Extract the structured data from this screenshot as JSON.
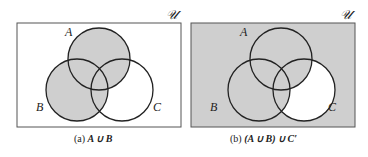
{
  "figure": {
    "panels": [
      {
        "id": "a",
        "caption_prefix": "(a)",
        "caption_expr": "A ∪ B",
        "universe_label": "𝒰",
        "labels": {
          "A": "A",
          "B": "B",
          "C": "C"
        },
        "shaded_regions": [
          "A",
          "B"
        ]
      },
      {
        "id": "b",
        "caption_prefix": "(b)",
        "caption_expr": "(A ∪ B) ∪ C′",
        "universe_label": "𝒰",
        "labels": {
          "A": "A",
          "B": "B",
          "C": "C"
        },
        "shaded_regions": [
          "everything except C \\ (A ∪ B)"
        ]
      }
    ],
    "colors": {
      "shade": "#cfcfcf",
      "stroke": "#222222",
      "background": "#ffffff"
    }
  }
}
